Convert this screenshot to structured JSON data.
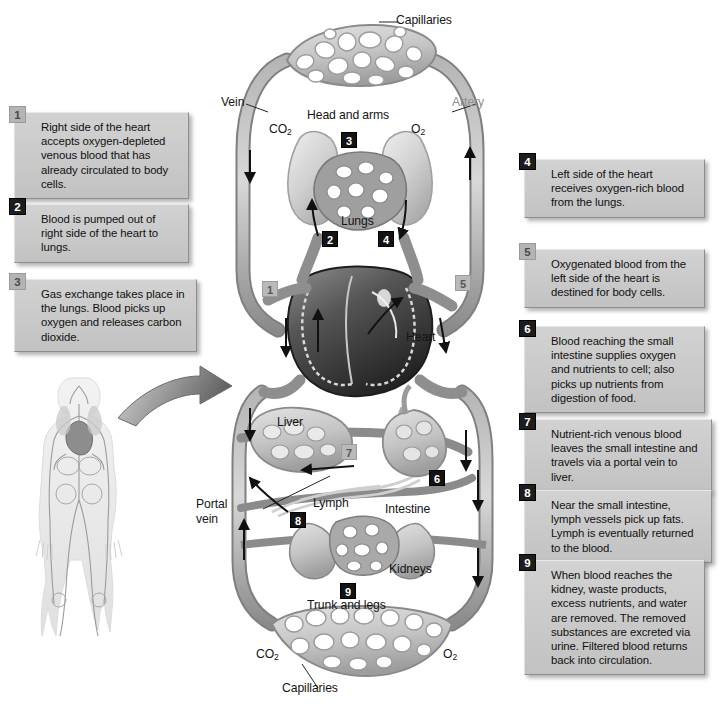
{
  "figure": {
    "type": "anatomical-flow-diagram"
  },
  "callouts": [
    {
      "number": "1",
      "badge_style": "light",
      "text": "Right side of the heart accepts oxygen-depleted venous blood that has already circulated to body cells."
    },
    {
      "number": "2",
      "badge_style": "dark",
      "text": "Blood is pumped out of right side of the heart to lungs."
    },
    {
      "number": "3",
      "badge_style": "light",
      "text": "Gas exchange takes place in the lungs. Blood picks up oxygen and releases carbon dioxide."
    },
    {
      "number": "4",
      "badge_style": "dark",
      "text": "Left side of the heart receives oxygen-rich blood from the lungs."
    },
    {
      "number": "5",
      "badge_style": "light",
      "text": "Oxygenated blood from the left side of the heart is destined for body cells."
    },
    {
      "number": "6",
      "badge_style": "dark",
      "text": "Blood reaching the small intestine supplies oxygen and nutrients to cell; also picks up nutrients from digestion of food."
    },
    {
      "number": "7",
      "badge_style": "dark",
      "text": "Nutrient-rich venous blood leaves the small intestine and travels via a portal vein to liver."
    },
    {
      "number": "8",
      "badge_style": "dark",
      "text": "Near the small intestine, lymph vessels pick up fats. Lymph is eventually returned to the blood."
    },
    {
      "number": "9",
      "badge_style": "dark",
      "text": "When blood reaches the kidney, waste products, excess nutrients, and water are removed. The removed substances are excreted via urine. Filtered blood returns back into circulation."
    }
  ],
  "diagram_labels": {
    "capillaries_top": "Capillaries",
    "capillaries_bottom": "Capillaries",
    "vein": "Vein",
    "artery": "Artery",
    "head_and_arms": "Head and arms",
    "lungs": "Lungs",
    "heart": "Heart",
    "liver": "Liver",
    "intestine": "Intestine",
    "lymph": "Lymph",
    "portal_vein": "Portal vein",
    "kidneys": "Kidneys",
    "trunk_and_legs": "Trunk and legs",
    "co2_top": "CO",
    "co2_top_sub": "2",
    "o2_top": "O",
    "o2_top_sub": "2",
    "co2_bottom": "CO",
    "co2_bottom_sub": "2",
    "o2_bottom": "O",
    "o2_bottom_sub": "2"
  },
  "diagram_markers": [
    {
      "number": "3",
      "style": "dark"
    },
    {
      "number": "2",
      "style": "dark"
    },
    {
      "number": "4",
      "style": "dark"
    },
    {
      "number": "1",
      "style": "light"
    },
    {
      "number": "5",
      "style": "light"
    },
    {
      "number": "7",
      "style": "light"
    },
    {
      "number": "6",
      "style": "dark"
    },
    {
      "number": "8",
      "style": "dark"
    },
    {
      "number": "9",
      "style": "dark"
    }
  ],
  "colors": {
    "vessel": "#8d8d8d",
    "vessel_dark": "#6a6a6a",
    "organ_light": "#c6c6c6",
    "heart_dark": "#2f2f2f",
    "callout_bg": "#c9c9c9",
    "badge_dark": "#1d1d1d",
    "badge_light": "#b4b4b4",
    "page_bg": "#ffffff"
  }
}
